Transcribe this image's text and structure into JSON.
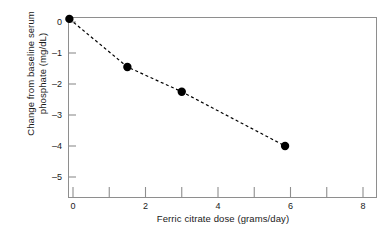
{
  "chart_data": {
    "type": "line",
    "title": "",
    "subtitle": "",
    "xlabel": "Ferric citrate dose (grams/day)",
    "ylabel_line1": "Change from baseline serum",
    "ylabel_line2": "phosphate (mg/dL)",
    "ylabel": "Change from baseline serum phosphate (mg/dL)",
    "x": [
      -0.1,
      1.5,
      3.0,
      5.85
    ],
    "values": [
      0.1,
      -1.45,
      -2.25,
      -4.0
    ],
    "series": [
      {
        "name": "Change from baseline serum phosphate",
        "x": [
          -0.1,
          1.5,
          3.0,
          5.85
        ],
        "values": [
          0.1,
          -1.45,
          -2.25,
          -4.0
        ]
      }
    ],
    "points": [
      {
        "x": -0.1,
        "y": 0.1
      },
      {
        "x": 1.5,
        "y": -1.45
      },
      {
        "x": 3.0,
        "y": -2.25
      },
      {
        "x": 5.85,
        "y": -4.0
      }
    ],
    "xlim": [
      -0.15,
      8.4
    ],
    "ylim": [
      -5.6,
      0.45
    ],
    "xticks": [
      0,
      2,
      4,
      6,
      8
    ],
    "xticks_minor": [
      1,
      3,
      5,
      7
    ],
    "xtick_labels": [
      "0",
      "2",
      "4",
      "6",
      "8"
    ],
    "yticks": [
      0,
      -1,
      -2,
      -3,
      -4,
      -5
    ],
    "ytick_labels": [
      "0",
      "–1",
      "–2",
      "–3",
      "–4",
      "–5"
    ],
    "grid": false,
    "legend": null,
    "legend_position": "none",
    "line_style": "dashed",
    "marker": "filled-circle",
    "colors": {
      "line": "#000000",
      "marker": "#000000",
      "frame": "#8e8e8e",
      "text": "#1a1a1a",
      "background": "#ffffff"
    }
  }
}
